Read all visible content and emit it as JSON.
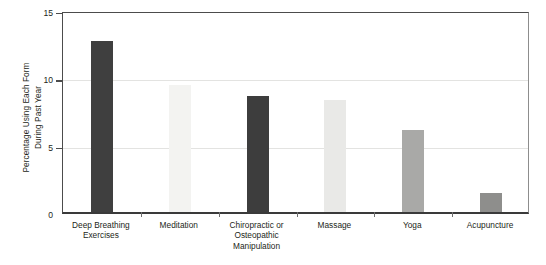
{
  "chart_data": {
    "type": "bar",
    "title": "",
    "subtitle": "",
    "xlabel": "",
    "ylabel": "Percentage Using Each Form\nDuring Past Year",
    "categories": [
      "Deep Breathing\nExercises",
      "Meditation",
      "Chiropractic or\nOsteopathic\nManipulation",
      "Massage",
      "Yoga",
      "Acupuncture"
    ],
    "values": [
      12.7,
      9.4,
      8.6,
      8.3,
      6.1,
      1.4
    ],
    "bar_colors": [
      "#3f3f3f",
      "#f3f3f1",
      "#3d3d3d",
      "#e9e9e7",
      "#a9a9a7",
      "#8e8e8c"
    ],
    "ylim": [
      0,
      15
    ],
    "yticks": [
      0,
      5,
      10,
      15
    ],
    "ytick_labels": [
      "0",
      "5",
      "10",
      "15"
    ],
    "grid": true,
    "grid_axis": "y",
    "legend": "none",
    "axis_color": "#4c4c4c",
    "grid_color": "#e3e3e1",
    "text_color": "#231f20",
    "background": "#ffffff"
  }
}
